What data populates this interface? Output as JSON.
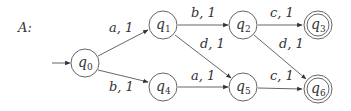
{
  "title": "A:",
  "states": [
    {
      "id": "q0",
      "name": "q",
      "sub": "0",
      "x": 85,
      "y": 63,
      "initial": true,
      "final": false
    },
    {
      "id": "q1",
      "name": "q",
      "sub": "1",
      "x": 163,
      "y": 25,
      "initial": false,
      "final": false
    },
    {
      "id": "q2",
      "name": "q",
      "sub": "2",
      "x": 243,
      "y": 25,
      "initial": false,
      "final": false
    },
    {
      "id": "q3",
      "name": "q",
      "sub": "3",
      "x": 318,
      "y": 25,
      "initial": false,
      "final": true
    },
    {
      "id": "q4",
      "name": "q",
      "sub": "4",
      "x": 163,
      "y": 87,
      "initial": false,
      "final": false
    },
    {
      "id": "q5",
      "name": "q",
      "sub": "5",
      "x": 243,
      "y": 87,
      "initial": false,
      "final": false
    },
    {
      "id": "q6",
      "name": "q",
      "sub": "6",
      "x": 318,
      "y": 89,
      "initial": false,
      "final": true
    }
  ],
  "transitions": [
    {
      "from": "q0",
      "to": "q1",
      "label": "a, 1"
    },
    {
      "from": "q0",
      "to": "q4",
      "label": "b, 1"
    },
    {
      "from": "q1",
      "to": "q2",
      "label": "b, 1"
    },
    {
      "from": "q1",
      "to": "q5",
      "label": "d, 1"
    },
    {
      "from": "q2",
      "to": "q3",
      "label": "c, 1"
    },
    {
      "from": "q2",
      "to": "q6",
      "label": "d, 1"
    },
    {
      "from": "q4",
      "to": "q5",
      "label": "a, 1"
    },
    {
      "from": "q5",
      "to": "q6",
      "label": "c, 1"
    }
  ]
}
